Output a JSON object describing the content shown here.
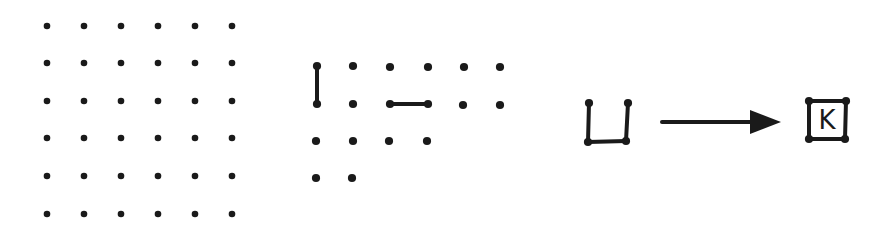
{
  "diagram": {
    "colors": {
      "ink": "#1a1a1a",
      "background": "#ffffff"
    },
    "dot_radius": 3.3,
    "panels": [
      {
        "id": "full-grid",
        "label": "6x6 dot grid",
        "dots": [
          [
            47,
            26
          ],
          [
            84,
            26
          ],
          [
            121,
            26
          ],
          [
            158,
            26
          ],
          [
            195,
            26
          ],
          [
            232,
            26
          ],
          [
            47,
            63
          ],
          [
            84,
            63
          ],
          [
            121,
            63
          ],
          [
            158,
            63
          ],
          [
            195,
            63
          ],
          [
            232,
            63
          ],
          [
            47,
            101
          ],
          [
            84,
            101
          ],
          [
            121,
            101
          ],
          [
            158,
            101
          ],
          [
            195,
            101
          ],
          [
            232,
            101
          ],
          [
            47,
            138
          ],
          [
            84,
            138
          ],
          [
            121,
            138
          ],
          [
            158,
            138
          ],
          [
            195,
            138
          ],
          [
            232,
            138
          ],
          [
            47,
            176
          ],
          [
            84,
            176
          ],
          [
            121,
            176
          ],
          [
            158,
            176
          ],
          [
            195,
            176
          ],
          [
            232,
            176
          ],
          [
            47,
            214
          ],
          [
            84,
            214
          ],
          [
            121,
            214
          ],
          [
            158,
            214
          ],
          [
            195,
            214
          ],
          [
            232,
            214
          ]
        ],
        "lines": []
      },
      {
        "id": "move-examples",
        "label": "Example moves: vertical and horizontal lines",
        "dots": [
          [
            317,
            66
          ],
          [
            353,
            66
          ],
          [
            390,
            67
          ],
          [
            428,
            67
          ],
          [
            464,
            67
          ],
          [
            500,
            67
          ],
          [
            317,
            104
          ],
          [
            353,
            104
          ],
          [
            390,
            104
          ],
          [
            428,
            104
          ],
          [
            463,
            105
          ],
          [
            500,
            105
          ],
          [
            316,
            141
          ],
          [
            353,
            141
          ],
          [
            389,
            141
          ],
          [
            427,
            141
          ],
          [
            316,
            178
          ],
          [
            352,
            178
          ]
        ],
        "lines": [
          [
            [
              317,
              66
            ],
            [
              317,
              104
            ]
          ],
          [
            [
              390,
              104
            ],
            [
              428,
              104
            ]
          ]
        ]
      },
      {
        "id": "open-box",
        "label": "Three-sided box",
        "dots": [
          [
            589,
            103
          ],
          [
            628,
            103
          ],
          [
            588,
            142
          ],
          [
            626,
            141
          ]
        ],
        "lines": [
          [
            [
              589,
              103
            ],
            [
              588,
              142
            ]
          ],
          [
            [
              588,
              142
            ],
            [
              626,
              141
            ]
          ],
          [
            [
              626,
              141
            ],
            [
              628,
              103
            ]
          ]
        ]
      },
      {
        "id": "arrow",
        "label": "completes to",
        "from": [
          662,
          122
        ],
        "to": [
          781,
          122
        ]
      },
      {
        "id": "closed-box",
        "label": "Completed box claimed by player",
        "dots": [
          [
            809,
            101
          ],
          [
            846,
            101
          ],
          [
            809,
            139
          ],
          [
            845,
            139
          ]
        ],
        "lines": [
          [
            [
              809,
              101
            ],
            [
              846,
              101
            ]
          ],
          [
            [
              846,
              101
            ],
            [
              845,
              139
            ]
          ],
          [
            [
              845,
              139
            ],
            [
              809,
              139
            ]
          ],
          [
            [
              809,
              139
            ],
            [
              809,
              101
            ]
          ]
        ],
        "initial": "K",
        "initial_pos": [
          827,
          129
        ]
      }
    ]
  }
}
